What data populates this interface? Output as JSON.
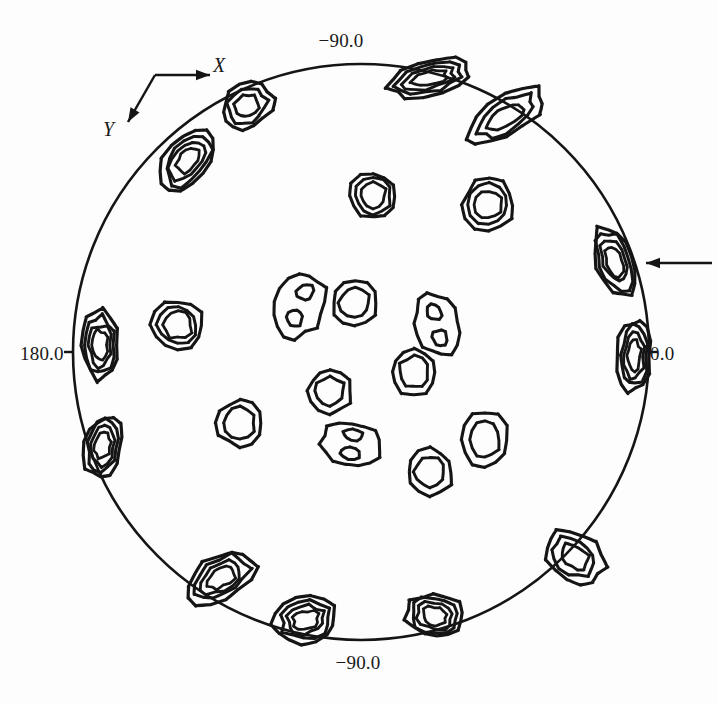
{
  "figure": {
    "kind": "pole-figure",
    "background_color": "#fdfdfd",
    "line_color": "#151515"
  },
  "axis_labels": {
    "top": "−90.0",
    "bottom": "−90.0",
    "left": "180.0",
    "right": "0.0",
    "x_direction": "X",
    "y_direction": "Y"
  },
  "annotations": {
    "pointer_arrow_label": ""
  },
  "chart_data": {
    "type": "contour",
    "title": "",
    "subtitle": "",
    "xlabel": "",
    "ylabel": "",
    "projection": "stereographic",
    "grid": false,
    "legend": "none",
    "outer_circle": {
      "cx": 361,
      "cy": 352,
      "r": 288
    },
    "azimuth_ticks": [
      {
        "angle_deg": 0,
        "label": "0.0",
        "position": "right"
      },
      {
        "angle_deg": 90,
        "label": "−90.0",
        "position": "top"
      },
      {
        "angle_deg": 180,
        "label": "180.0",
        "position": "left"
      },
      {
        "angle_deg": 270,
        "label": "−90.0",
        "position": "bottom"
      }
    ],
    "reference_axes": [
      {
        "name": "X",
        "from": [
          155,
          75
        ],
        "to": [
          210,
          75
        ],
        "label_at": [
          216,
          66
        ]
      },
      {
        "name": "Y",
        "from": [
          155,
          75
        ],
        "to": [
          128,
          122
        ],
        "label_at": [
          106,
          130
        ]
      }
    ],
    "pointer_arrow": {
      "from": [
        712,
        263
      ],
      "to": [
        646,
        263
      ],
      "points_to_peak": "rim-east-upper"
    },
    "peaks": [
      {
        "id": "rim-n-left",
        "cx": 430,
        "cy": 78,
        "rx": 42,
        "ry": 17,
        "rot": -13,
        "levels": 4,
        "type": "rim",
        "twin": false
      },
      {
        "id": "rim-ne",
        "cx": 506,
        "cy": 116,
        "rx": 44,
        "ry": 19,
        "rot": -31,
        "levels": 3,
        "type": "rim",
        "twin": false
      },
      {
        "id": "rim-east-upper",
        "cx": 615,
        "cy": 262,
        "rx": 20,
        "ry": 37,
        "rot": -20,
        "levels": 4,
        "type": "rim",
        "twin": false
      },
      {
        "id": "rim-east-lower",
        "cx": 634,
        "cy": 356,
        "rx": 17,
        "ry": 36,
        "rot": 3,
        "levels": 4,
        "type": "rim",
        "twin": false
      },
      {
        "id": "rim-se",
        "cx": 575,
        "cy": 557,
        "rx": 32,
        "ry": 23,
        "rot": 36,
        "levels": 3,
        "type": "rim",
        "twin": false
      },
      {
        "id": "rim-s-right",
        "cx": 435,
        "cy": 616,
        "rx": 30,
        "ry": 22,
        "rot": 12,
        "levels": 4,
        "type": "rim",
        "twin": false
      },
      {
        "id": "rim-s-left",
        "cx": 306,
        "cy": 620,
        "rx": 32,
        "ry": 23,
        "rot": -8,
        "levels": 4,
        "type": "rim",
        "twin": false
      },
      {
        "id": "rim-sw",
        "cx": 222,
        "cy": 577,
        "rx": 37,
        "ry": 22,
        "rot": -32,
        "levels": 4,
        "type": "rim",
        "twin": false
      },
      {
        "id": "rim-west-lower",
        "cx": 103,
        "cy": 446,
        "rx": 19,
        "ry": 31,
        "rot": 12,
        "levels": 4,
        "type": "rim",
        "twin": false
      },
      {
        "id": "rim-west-upper",
        "cx": 100,
        "cy": 345,
        "rx": 19,
        "ry": 35,
        "rot": -3,
        "levels": 4,
        "type": "rim",
        "twin": false
      },
      {
        "id": "rim-nw",
        "cx": 188,
        "cy": 160,
        "rx": 23,
        "ry": 36,
        "rot": 40,
        "levels": 4,
        "type": "rim",
        "twin": false
      },
      {
        "id": "rim-n-far",
        "cx": 247,
        "cy": 106,
        "rx": 28,
        "ry": 22,
        "rot": -36,
        "levels": 3,
        "type": "rim",
        "twin": false
      },
      {
        "id": "mid-ne",
        "cx": 489,
        "cy": 205,
        "rx": 26,
        "ry": 26,
        "rot": 0,
        "levels": 3,
        "type": "interior",
        "twin": false
      },
      {
        "id": "mid-nw",
        "cx": 373,
        "cy": 196,
        "rx": 24,
        "ry": 23,
        "rot": 0,
        "levels": 3,
        "type": "interior",
        "twin": false
      },
      {
        "id": "mid-w",
        "cx": 178,
        "cy": 325,
        "rx": 26,
        "ry": 25,
        "rot": 0,
        "levels": 3,
        "type": "interior",
        "twin": false
      },
      {
        "id": "ctr-nw-twin",
        "cx": 300,
        "cy": 305,
        "rx": 25,
        "ry": 33,
        "rot": 22,
        "levels": 2,
        "type": "interior",
        "twin": true
      },
      {
        "id": "ctr-n",
        "cx": 355,
        "cy": 303,
        "rx": 23,
        "ry": 23,
        "rot": 0,
        "levels": 2,
        "type": "interior",
        "twin": false
      },
      {
        "id": "ctr-ne-twin",
        "cx": 437,
        "cy": 325,
        "rx": 23,
        "ry": 31,
        "rot": -13,
        "levels": 2,
        "type": "interior",
        "twin": true
      },
      {
        "id": "ctr-e",
        "cx": 414,
        "cy": 372,
        "rx": 23,
        "ry": 23,
        "rot": 0,
        "levels": 2,
        "type": "interior",
        "twin": false
      },
      {
        "id": "ctr-sw",
        "cx": 330,
        "cy": 391,
        "rx": 22,
        "ry": 22,
        "rot": 0,
        "levels": 2,
        "type": "interior",
        "twin": false
      },
      {
        "id": "ctr-s-twin",
        "cx": 352,
        "cy": 444,
        "rx": 31,
        "ry": 22,
        "rot": 8,
        "levels": 2,
        "type": "interior",
        "twin": true
      },
      {
        "id": "ctr-sw-far",
        "cx": 240,
        "cy": 423,
        "rx": 23,
        "ry": 23,
        "rot": 0,
        "levels": 2,
        "type": "interior",
        "twin": false
      },
      {
        "id": "mid-se",
        "cx": 485,
        "cy": 440,
        "rx": 24,
        "ry": 28,
        "rot": 0,
        "levels": 2,
        "type": "interior",
        "twin": false
      },
      {
        "id": "mid-s",
        "cx": 430,
        "cy": 472,
        "rx": 23,
        "ry": 23,
        "rot": 0,
        "levels": 2,
        "type": "interior",
        "twin": false
      }
    ]
  }
}
